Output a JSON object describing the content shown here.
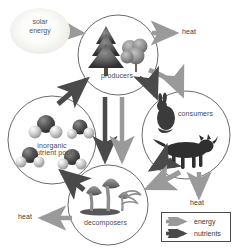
{
  "diagram": {
    "background": "#ffffff",
    "colors": {
      "energy_arrow": "#9a9a9a",
      "nutrient_arrow": "#4a4a4a",
      "circle_outline": "#6b6b6b",
      "label_text": "#3a3a3a"
    }
  },
  "source": {
    "name": "solar-energy",
    "label_line1": "solar",
    "label_line2": "energy"
  },
  "nodes": [
    {
      "id": "producers",
      "label": "producers",
      "contents": "conifer tree and shrub"
    },
    {
      "id": "consumers",
      "label": "consumers",
      "contents": "rabbit and fox"
    },
    {
      "id": "decomposers",
      "label": "decomposers",
      "contents": "mushrooms and worm"
    },
    {
      "id": "inorganic-nutrient-pool",
      "label_line1": "inorganic",
      "label_line2": "nutrient pool",
      "label": "inorganic nutrient pool",
      "contents": "molecule models"
    }
  ],
  "heat_labels": [
    {
      "id": "heat-producers",
      "label": "heat"
    },
    {
      "id": "heat-consumers",
      "label": "heat"
    },
    {
      "id": "heat-decomposers",
      "label": "heat"
    }
  ],
  "legend": {
    "name": "legend",
    "items": [
      {
        "id": "energy",
        "label": "energy",
        "color": "#9a9a9a"
      },
      {
        "id": "nutrients",
        "label": "nutrients",
        "color": "#4a4a4a"
      }
    ]
  },
  "flows": [
    {
      "from": "solar-energy",
      "to": "producers",
      "type": "energy"
    },
    {
      "from": "producers",
      "to": "heat",
      "type": "energy"
    },
    {
      "from": "producers",
      "to": "consumers",
      "type": "energy"
    },
    {
      "from": "producers",
      "to": "consumers",
      "type": "nutrients"
    },
    {
      "from": "producers",
      "to": "decomposers",
      "type": "energy"
    },
    {
      "from": "producers",
      "to": "decomposers",
      "type": "nutrients"
    },
    {
      "from": "consumers",
      "to": "heat",
      "type": "energy"
    },
    {
      "from": "consumers",
      "to": "decomposers",
      "type": "energy"
    },
    {
      "from": "consumers",
      "to": "decomposers",
      "type": "nutrients"
    },
    {
      "from": "decomposers",
      "to": "heat",
      "type": "energy"
    },
    {
      "from": "decomposers",
      "to": "inorganic-nutrient-pool",
      "type": "nutrients"
    },
    {
      "from": "inorganic-nutrient-pool",
      "to": "producers",
      "type": "nutrients"
    }
  ]
}
